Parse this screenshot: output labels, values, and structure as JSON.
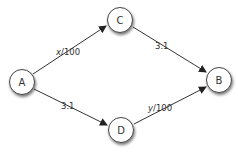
{
  "diagram": {
    "colors": {
      "node_fill": "#ffffff",
      "node_stroke": "#444444",
      "edge": "#333333",
      "text": "#333333"
    },
    "nodes": {
      "A": {
        "label": "A"
      },
      "B": {
        "label": "B"
      },
      "C": {
        "label": "C"
      },
      "D": {
        "label": "D"
      }
    },
    "edges": {
      "a_c": {
        "from": "A",
        "to": "C",
        "var": "x",
        "rest": "/100"
      },
      "c_b": {
        "from": "C",
        "to": "B",
        "label": "3.1"
      },
      "a_d": {
        "from": "A",
        "to": "D",
        "label": "3.1"
      },
      "d_b": {
        "from": "D",
        "to": "B",
        "var": "y",
        "rest": "/100"
      }
    }
  }
}
